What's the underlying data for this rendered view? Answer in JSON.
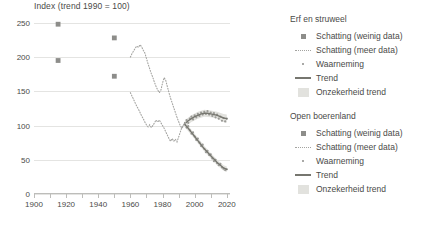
{
  "chart_data": {
    "type": "line",
    "title": "Index (trend 1990 = 100)",
    "xlabel": "",
    "ylabel": "",
    "xlim": [
      1900,
      2022
    ],
    "ylim": [
      0,
      260
    ],
    "yticks": [
      0,
      50,
      100,
      150,
      200,
      250
    ],
    "xticks": [
      1900,
      1920,
      1940,
      1960,
      1980,
      2000,
      2020
    ],
    "xticks_minor": [
      1910,
      1930,
      1950,
      1970,
      1990,
      2010
    ],
    "grid": "horizontal",
    "legend_position": "right",
    "colors": {
      "marker": "#8d8d8a",
      "dotted": "#a3a3a0",
      "trend": "#76766f",
      "observation": "#9a9a96",
      "band": "#e2e2de",
      "grid": "#e4e4e2",
      "axis": "#bdbdba",
      "text": "#4a4a48"
    },
    "series": [
      {
        "name": "Erf en struweel",
        "estimates_few_data": [
          {
            "x": 1915,
            "y": 248
          },
          {
            "x": 1950,
            "y": 228
          }
        ],
        "estimates_more_data": [
          {
            "x": 1960,
            "y": 200
          },
          {
            "x": 1961,
            "y": 205
          },
          {
            "x": 1962,
            "y": 209
          },
          {
            "x": 1963,
            "y": 213
          },
          {
            "x": 1964,
            "y": 216
          },
          {
            "x": 1965,
            "y": 214
          },
          {
            "x": 1966,
            "y": 218
          },
          {
            "x": 1967,
            "y": 215
          },
          {
            "x": 1968,
            "y": 210
          },
          {
            "x": 1969,
            "y": 206
          },
          {
            "x": 1970,
            "y": 198
          },
          {
            "x": 1971,
            "y": 190
          },
          {
            "x": 1972,
            "y": 183
          },
          {
            "x": 1973,
            "y": 176
          },
          {
            "x": 1974,
            "y": 170
          },
          {
            "x": 1975,
            "y": 163
          },
          {
            "x": 1976,
            "y": 157
          },
          {
            "x": 1977,
            "y": 152
          },
          {
            "x": 1978,
            "y": 148
          },
          {
            "x": 1979,
            "y": 152
          },
          {
            "x": 1980,
            "y": 162
          },
          {
            "x": 1981,
            "y": 170
          },
          {
            "x": 1982,
            "y": 166
          },
          {
            "x": 1983,
            "y": 157
          },
          {
            "x": 1984,
            "y": 148
          },
          {
            "x": 1985,
            "y": 140
          },
          {
            "x": 1986,
            "y": 133
          },
          {
            "x": 1987,
            "y": 126
          },
          {
            "x": 1988,
            "y": 119
          },
          {
            "x": 1989,
            "y": 112
          },
          {
            "x": 1990,
            "y": 106
          },
          {
            "x": 1991,
            "y": 100
          },
          {
            "x": 1992,
            "y": 96
          },
          {
            "x": 1993,
            "y": 99
          },
          {
            "x": 1994,
            "y": 104
          }
        ],
        "observations": [
          {
            "x": 1994,
            "y": 104
          },
          {
            "x": 1995,
            "y": 108
          },
          {
            "x": 1996,
            "y": 104
          },
          {
            "x": 1997,
            "y": 110
          },
          {
            "x": 1998,
            "y": 113
          },
          {
            "x": 1999,
            "y": 109
          },
          {
            "x": 2000,
            "y": 115
          },
          {
            "x": 2001,
            "y": 112
          },
          {
            "x": 2002,
            "y": 117
          },
          {
            "x": 2003,
            "y": 114
          },
          {
            "x": 2004,
            "y": 119
          },
          {
            "x": 2005,
            "y": 116
          },
          {
            "x": 2006,
            "y": 120
          },
          {
            "x": 2007,
            "y": 117
          },
          {
            "x": 2008,
            "y": 121
          },
          {
            "x": 2009,
            "y": 116
          },
          {
            "x": 2010,
            "y": 119
          },
          {
            "x": 2011,
            "y": 114
          },
          {
            "x": 2012,
            "y": 118
          },
          {
            "x": 2013,
            "y": 112
          },
          {
            "x": 2014,
            "y": 116
          },
          {
            "x": 2015,
            "y": 110
          },
          {
            "x": 2016,
            "y": 113
          },
          {
            "x": 2017,
            "y": 107
          },
          {
            "x": 2018,
            "y": 111
          },
          {
            "x": 2019,
            "y": 106
          },
          {
            "x": 2020,
            "y": 110
          }
        ],
        "trend": [
          {
            "x": 1994,
            "y": 103
          },
          {
            "x": 1996,
            "y": 107
          },
          {
            "x": 1998,
            "y": 110
          },
          {
            "x": 2000,
            "y": 113
          },
          {
            "x": 2002,
            "y": 115
          },
          {
            "x": 2004,
            "y": 117
          },
          {
            "x": 2006,
            "y": 118
          },
          {
            "x": 2008,
            "y": 118
          },
          {
            "x": 2010,
            "y": 117
          },
          {
            "x": 2012,
            "y": 116
          },
          {
            "x": 2014,
            "y": 115
          },
          {
            "x": 2016,
            "y": 113
          },
          {
            "x": 2018,
            "y": 111
          },
          {
            "x": 2020,
            "y": 110
          }
        ],
        "trend_uncertainty": {
          "upper": [
            {
              "x": 1994,
              "y": 108
            },
            {
              "x": 1998,
              "y": 115
            },
            {
              "x": 2002,
              "y": 120
            },
            {
              "x": 2006,
              "y": 123
            },
            {
              "x": 2010,
              "y": 122
            },
            {
              "x": 2014,
              "y": 120
            },
            {
              "x": 2018,
              "y": 117
            },
            {
              "x": 2020,
              "y": 116
            }
          ],
          "lower": [
            {
              "x": 1994,
              "y": 98
            },
            {
              "x": 1998,
              "y": 105
            },
            {
              "x": 2002,
              "y": 110
            },
            {
              "x": 2006,
              "y": 113
            },
            {
              "x": 2010,
              "y": 112
            },
            {
              "x": 2014,
              "y": 110
            },
            {
              "x": 2018,
              "y": 105
            },
            {
              "x": 2020,
              "y": 104
            }
          ]
        }
      },
      {
        "name": "Open boerenland",
        "estimates_few_data": [
          {
            "x": 1915,
            "y": 195
          },
          {
            "x": 1950,
            "y": 172
          }
        ],
        "estimates_more_data": [
          {
            "x": 1960,
            "y": 148
          },
          {
            "x": 1961,
            "y": 143
          },
          {
            "x": 1962,
            "y": 138
          },
          {
            "x": 1963,
            "y": 133
          },
          {
            "x": 1964,
            "y": 128
          },
          {
            "x": 1965,
            "y": 124
          },
          {
            "x": 1966,
            "y": 119
          },
          {
            "x": 1967,
            "y": 114
          },
          {
            "x": 1968,
            "y": 110
          },
          {
            "x": 1969,
            "y": 105
          },
          {
            "x": 1970,
            "y": 101
          },
          {
            "x": 1971,
            "y": 98
          },
          {
            "x": 1972,
            "y": 101
          },
          {
            "x": 1973,
            "y": 97
          },
          {
            "x": 1974,
            "y": 100
          },
          {
            "x": 1975,
            "y": 104
          },
          {
            "x": 1976,
            "y": 108
          },
          {
            "x": 1977,
            "y": 105
          },
          {
            "x": 1978,
            "y": 108
          },
          {
            "x": 1979,
            "y": 104
          },
          {
            "x": 1980,
            "y": 100
          },
          {
            "x": 1981,
            "y": 96
          },
          {
            "x": 1982,
            "y": 91
          },
          {
            "x": 1983,
            "y": 86
          },
          {
            "x": 1984,
            "y": 81
          },
          {
            "x": 1985,
            "y": 77
          },
          {
            "x": 1986,
            "y": 81
          },
          {
            "x": 1987,
            "y": 77
          },
          {
            "x": 1988,
            "y": 80
          },
          {
            "x": 1989,
            "y": 76
          },
          {
            "x": 1990,
            "y": 83
          },
          {
            "x": 1991,
            "y": 90
          },
          {
            "x": 1992,
            "y": 97
          },
          {
            "x": 1993,
            "y": 101
          },
          {
            "x": 1994,
            "y": 104
          }
        ],
        "observations": [
          {
            "x": 1994,
            "y": 102
          },
          {
            "x": 1995,
            "y": 97
          },
          {
            "x": 1996,
            "y": 99
          },
          {
            "x": 1997,
            "y": 93
          },
          {
            "x": 1998,
            "y": 88
          },
          {
            "x": 1999,
            "y": 90
          },
          {
            "x": 2000,
            "y": 84
          },
          {
            "x": 2001,
            "y": 79
          },
          {
            "x": 2002,
            "y": 81
          },
          {
            "x": 2003,
            "y": 75
          },
          {
            "x": 2004,
            "y": 70
          },
          {
            "x": 2005,
            "y": 72
          },
          {
            "x": 2006,
            "y": 66
          },
          {
            "x": 2007,
            "y": 61
          },
          {
            "x": 2008,
            "y": 63
          },
          {
            "x": 2009,
            "y": 57
          },
          {
            "x": 2010,
            "y": 58
          },
          {
            "x": 2011,
            "y": 52
          },
          {
            "x": 2012,
            "y": 48
          },
          {
            "x": 2013,
            "y": 50
          },
          {
            "x": 2014,
            "y": 45
          },
          {
            "x": 2015,
            "y": 42
          },
          {
            "x": 2016,
            "y": 44
          },
          {
            "x": 2017,
            "y": 39
          },
          {
            "x": 2018,
            "y": 37
          },
          {
            "x": 2019,
            "y": 35
          },
          {
            "x": 2020,
            "y": 36
          }
        ],
        "trend": [
          {
            "x": 1994,
            "y": 101
          },
          {
            "x": 1996,
            "y": 96
          },
          {
            "x": 1998,
            "y": 90
          },
          {
            "x": 2000,
            "y": 84
          },
          {
            "x": 2002,
            "y": 78
          },
          {
            "x": 2004,
            "y": 72
          },
          {
            "x": 2006,
            "y": 66
          },
          {
            "x": 2008,
            "y": 61
          },
          {
            "x": 2010,
            "y": 56
          },
          {
            "x": 2012,
            "y": 51
          },
          {
            "x": 2014,
            "y": 46
          },
          {
            "x": 2016,
            "y": 42
          },
          {
            "x": 2018,
            "y": 38
          },
          {
            "x": 2020,
            "y": 36
          }
        ],
        "trend_uncertainty": {
          "upper": [
            {
              "x": 1994,
              "y": 105
            },
            {
              "x": 1998,
              "y": 94
            },
            {
              "x": 2002,
              "y": 82
            },
            {
              "x": 2006,
              "y": 70
            },
            {
              "x": 2010,
              "y": 60
            },
            {
              "x": 2014,
              "y": 50
            },
            {
              "x": 2018,
              "y": 42
            },
            {
              "x": 2020,
              "y": 40
            }
          ],
          "lower": [
            {
              "x": 1994,
              "y": 97
            },
            {
              "x": 1998,
              "y": 86
            },
            {
              "x": 2002,
              "y": 74
            },
            {
              "x": 2006,
              "y": 62
            },
            {
              "x": 2010,
              "y": 52
            },
            {
              "x": 2014,
              "y": 42
            },
            {
              "x": 2018,
              "y": 34
            },
            {
              "x": 2020,
              "y": 32
            }
          ]
        }
      }
    ]
  },
  "legend": {
    "groups": [
      {
        "heading": "Erf en struweel",
        "entries": [
          {
            "key": "square",
            "label": "Schatting (weinig data)"
          },
          {
            "key": "dotted",
            "label": "Schatting (meer data)"
          },
          {
            "key": "dot",
            "label": "Waarneming"
          },
          {
            "key": "solid",
            "label": "Trend"
          },
          {
            "key": "band",
            "label": "Onzekerheid trend"
          }
        ]
      },
      {
        "heading": "Open boerenland",
        "entries": [
          {
            "key": "square",
            "label": "Schatting (weinig data)"
          },
          {
            "key": "dotted",
            "label": "Schatting (meer data)"
          },
          {
            "key": "dot",
            "label": "Waarneming"
          },
          {
            "key": "solid",
            "label": "Trend"
          },
          {
            "key": "band",
            "label": "Onzekerheid trend"
          }
        ]
      }
    ]
  }
}
